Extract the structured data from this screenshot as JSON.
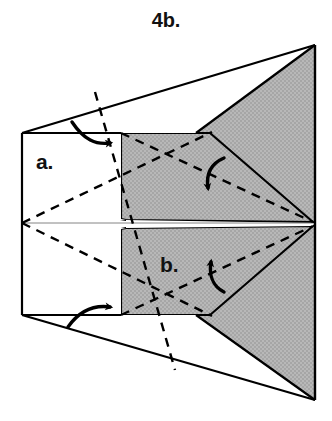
{
  "figure": {
    "title": "4b.",
    "type": "origami-fold-diagram",
    "labels": [
      {
        "id": "a",
        "text": "a.",
        "x": 36,
        "y": 150
      },
      {
        "id": "b",
        "text": "b.",
        "x": 160,
        "y": 253
      }
    ],
    "colors": {
      "paper_front": "#ffffff",
      "paper_back": "#b3b3b3",
      "outline": "#000000",
      "fold_line": "#000000",
      "label": "#111111"
    },
    "geometry": {
      "outer_top_right": [
        315,
        45
      ],
      "outer_bottom_right": [
        315,
        400
      ],
      "center_right_point": [
        313,
        223
      ],
      "rect_top_left": [
        22,
        133
      ],
      "rect_bottom_left": [
        22,
        315
      ],
      "gray_left_x": 121,
      "gray_top_y": 133,
      "gray_bottom_y": 315,
      "notch_upper_y": 219,
      "notch_lower_y": 229,
      "shoulder_x": 210
    },
    "arrows": [
      {
        "id": "arrow-fold-a-top",
        "kind": "curved-arrow",
        "direction": "right",
        "near": "a"
      },
      {
        "id": "arrow-fold-a-bottom",
        "kind": "curved-arrow",
        "direction": "right",
        "near": "a"
      },
      {
        "id": "arrow-fold-upper",
        "kind": "curved-arrow",
        "direction": "down",
        "near": "upper-flap"
      },
      {
        "id": "arrow-fold-b",
        "kind": "curved-arrow",
        "direction": "up",
        "near": "b"
      }
    ],
    "dashed_lines": [
      {
        "from": [
          22,
          223
        ],
        "to": [
          210,
          133
        ]
      },
      {
        "from": [
          22,
          223
        ],
        "to": [
          210,
          315
        ]
      },
      {
        "from": [
          121,
          133
        ],
        "to": [
          313,
          223
        ]
      },
      {
        "from": [
          121,
          315
        ],
        "to": [
          313,
          225
        ]
      },
      {
        "from": [
          95,
          92
        ],
        "to": [
          175,
          370
        ]
      }
    ]
  }
}
